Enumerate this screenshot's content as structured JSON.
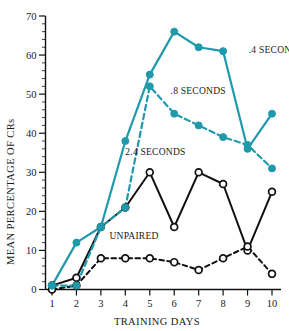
{
  "chart_data": {
    "type": "line",
    "title": "",
    "xlabel": "TRAINING DAYS",
    "ylabel": "MEAN PERCENTAGE OF CRs",
    "x": [
      1,
      2,
      3,
      4,
      5,
      6,
      7,
      8,
      9,
      10
    ],
    "xtick_labels": [
      "1",
      "2",
      "3",
      "4",
      "5",
      "6",
      "7",
      "8",
      "9",
      "10"
    ],
    "ytick_labels": [
      "0",
      "10",
      "20",
      "30",
      "40",
      "50",
      "60",
      "70"
    ],
    "yticks": [
      0,
      10,
      20,
      30,
      40,
      50,
      60,
      70
    ],
    "ylim": [
      0,
      70
    ],
    "xlim": [
      1,
      10
    ],
    "y_minor_tick_step": 2,
    "grid": false,
    "legend_position": "inline-annotations",
    "series": [
      {
        "name": ".4 SECONDS",
        "values": [
          1,
          12,
          16,
          38,
          55,
          66,
          62,
          61,
          36,
          45
        ],
        "color": "#1f9aab",
        "linestyle": "solid",
        "marker": "filled-circle",
        "label_x": 9.05,
        "label_y": 60.5
      },
      {
        "name": ".8 SECONDS",
        "values": [
          1,
          1,
          16,
          21,
          52,
          45,
          42,
          39,
          37,
          31
        ],
        "color": "#1f9aab",
        "linestyle": "dashed",
        "marker": "filled-circle",
        "label_x": 5.85,
        "label_y": 50.0
      },
      {
        "name": "2.4 SECONDS",
        "values": [
          1,
          3,
          16,
          21,
          30,
          16,
          30,
          27,
          10,
          25
        ],
        "color": "#111111",
        "linestyle": "solid",
        "marker": "open-circle",
        "label_x": 4.0,
        "label_y": 34.5
      },
      {
        "name": "UNPAIRED",
        "values": [
          0,
          1,
          8,
          8,
          8,
          7,
          5,
          8,
          11,
          4
        ],
        "color": "#111111",
        "linestyle": "dashed",
        "marker": "open-circle",
        "label_x": 3.35,
        "label_y": 12.8
      }
    ]
  },
  "axes": {
    "y_title": "MEAN PERCENTAGE OF CRs",
    "x_title": "TRAINING DAYS"
  }
}
